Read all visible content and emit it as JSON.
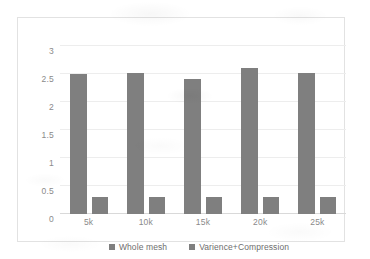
{
  "chart_data": {
    "type": "bar",
    "title": "",
    "xlabel": "",
    "ylabel": "",
    "categories": [
      "5k",
      "10k",
      "15k",
      "20k",
      "25k"
    ],
    "series": [
      {
        "name": "Whole mesh",
        "color": "#7f7f7f",
        "values": [
          2.5,
          2.51,
          2.41,
          2.6,
          2.52
        ]
      },
      {
        "name": "Varience+Compression",
        "color": "#7f7f7f",
        "values": [
          0.3,
          0.3,
          0.3,
          0.3,
          0.31
        ]
      }
    ],
    "ylim": [
      0,
      3
    ],
    "yticks": [
      "0",
      "0.5",
      "1",
      "1.5",
      "2",
      "2.5",
      "3"
    ],
    "ytick_values": [
      0,
      0.5,
      1,
      1.5,
      2,
      2.5,
      3
    ],
    "grid": "horizontal",
    "legend_position": "bottom",
    "plot_background": "#ffffff",
    "gridline_color": "#ededed",
    "frame_color": "#e2e2e2",
    "axis_text_color": "#8a8a8a"
  },
  "legend": {
    "items": [
      {
        "label": "Whole mesh",
        "swatch": "#7f7f7f"
      },
      {
        "label": "Varience+Compression",
        "swatch": "#7f7f7f"
      }
    ]
  }
}
